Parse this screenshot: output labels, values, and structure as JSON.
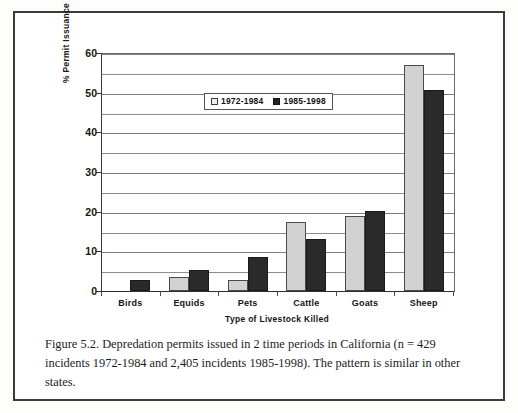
{
  "figure": {
    "caption": "Figure 5.2. Depredation permits issued in 2 time periods in California (n = 429 incidents 1972-1984 and 2,405 incidents 1985-1998). The pattern is similar in other states."
  },
  "chart_data": {
    "type": "bar",
    "title": "",
    "xlabel": "Type of Livestock Killed",
    "ylabel": "% Permit Issuance",
    "ylim": [
      0,
      60
    ],
    "y_ticks": [
      0,
      10,
      20,
      30,
      40,
      50,
      60
    ],
    "y_gridlines": [
      5,
      10,
      15,
      20,
      25,
      30,
      35,
      40,
      45,
      50,
      55,
      60
    ],
    "grid": true,
    "legend_position": "upper-center-inside",
    "categories": [
      "Birds",
      "Equids",
      "Pets",
      "Cattle",
      "Goats",
      "Sheep"
    ],
    "series": [
      {
        "name": "1972-1984",
        "color": "#d2d2d2",
        "values": [
          0,
          3.5,
          2.7,
          17.5,
          19.0,
          57.0
        ]
      },
      {
        "name": "1985-1998",
        "color": "#2a2a2a",
        "values": [
          2.7,
          5.4,
          8.5,
          13.0,
          20.2,
          50.6
        ]
      }
    ]
  }
}
